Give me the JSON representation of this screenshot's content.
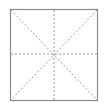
{
  "figure": {
    "type": "rice-grid",
    "icon": "character-practice-grid-icon",
    "border_color": "#8a8a8a",
    "guide_color": "#9a9a9a",
    "square": {
      "x": 10,
      "y": 9,
      "width": 87,
      "height": 91
    },
    "guides": [
      "vertical",
      "horizontal",
      "diagonal-down",
      "diagonal-up"
    ]
  }
}
